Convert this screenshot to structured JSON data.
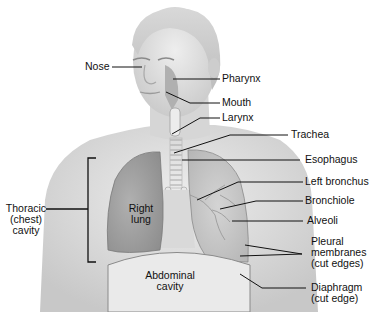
{
  "diagram": {
    "labels": {
      "nose": "Nose",
      "pharynx": "Pharynx",
      "mouth": "Mouth",
      "larynx": "Larynx",
      "trachea": "Trachea",
      "esophagus": "Esophagus",
      "left_bronchus": "Left bronchus",
      "bronchiole": "Bronchiole",
      "alveoli": "Alveoli",
      "pleural_1": "Pleural",
      "pleural_2": "membranes",
      "pleural_3": "(cut edges)",
      "diaphragm_1": "Diaphragm",
      "diaphragm_2": "(cut edge)",
      "thoracic_1": "Thoracic",
      "thoracic_2": "(chest)",
      "thoracic_3": "cavity",
      "right_lung_1": "Right",
      "right_lung_2": "lung",
      "abdominal_1": "Abdominal",
      "abdominal_2": "cavity"
    },
    "colors": {
      "skin_light": "#e6e6e6",
      "skin_mid": "#cfcfcf",
      "lung_dark": "#9a9a9a",
      "lung_light": "#bdbdbd",
      "leader_line": "#111111"
    }
  }
}
